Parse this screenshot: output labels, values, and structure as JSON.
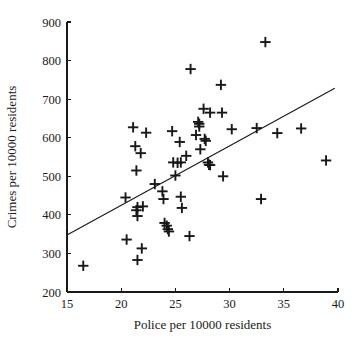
{
  "chart_data": {
    "type": "scatter",
    "title": "",
    "xlabel": "Police per 10000 residents",
    "ylabel": "Crimes per 10000 residents",
    "xlim": [
      15,
      40
    ],
    "ylim": [
      200,
      900
    ],
    "xticks": [
      15,
      20,
      25,
      30,
      35,
      40
    ],
    "yticks": [
      200,
      300,
      400,
      500,
      600,
      700,
      800,
      900
    ],
    "xtick_labels": [
      "15",
      "20",
      "25",
      "30",
      "35",
      "40"
    ],
    "ytick_labels": [
      "200",
      "300",
      "400",
      "500",
      "600",
      "700",
      "800",
      "900"
    ],
    "grid": false,
    "legend": null,
    "marker": "plus",
    "marker_color": "#16181a",
    "line_color": "#1a1a1a",
    "trendline": {
      "label": "least-squares fit line",
      "x_start": 15.0,
      "y_start": 348,
      "x_end": 39.7,
      "y_end": 728
    },
    "points": [
      {
        "x": 16.5,
        "y": 268
      },
      {
        "x": 20.4,
        "y": 445
      },
      {
        "x": 20.5,
        "y": 336
      },
      {
        "x": 21.1,
        "y": 627
      },
      {
        "x": 21.3,
        "y": 578
      },
      {
        "x": 21.4,
        "y": 515
      },
      {
        "x": 21.4,
        "y": 412
      },
      {
        "x": 21.5,
        "y": 420
      },
      {
        "x": 21.5,
        "y": 397
      },
      {
        "x": 21.5,
        "y": 283
      },
      {
        "x": 21.8,
        "y": 560
      },
      {
        "x": 21.9,
        "y": 313
      },
      {
        "x": 22.0,
        "y": 422
      },
      {
        "x": 22.3,
        "y": 613
      },
      {
        "x": 23.1,
        "y": 480
      },
      {
        "x": 23.8,
        "y": 461
      },
      {
        "x": 23.9,
        "y": 441
      },
      {
        "x": 24.0,
        "y": 379
      },
      {
        "x": 24.2,
        "y": 372
      },
      {
        "x": 24.3,
        "y": 363
      },
      {
        "x": 24.4,
        "y": 357
      },
      {
        "x": 24.7,
        "y": 617
      },
      {
        "x": 24.8,
        "y": 536
      },
      {
        "x": 25.0,
        "y": 502
      },
      {
        "x": 25.2,
        "y": 535
      },
      {
        "x": 25.4,
        "y": 589
      },
      {
        "x": 25.5,
        "y": 536
      },
      {
        "x": 25.5,
        "y": 447
      },
      {
        "x": 25.6,
        "y": 418
      },
      {
        "x": 26.0,
        "y": 553
      },
      {
        "x": 26.3,
        "y": 345
      },
      {
        "x": 26.4,
        "y": 778
      },
      {
        "x": 26.9,
        "y": 607
      },
      {
        "x": 27.1,
        "y": 641
      },
      {
        "x": 27.2,
        "y": 636
      },
      {
        "x": 27.2,
        "y": 629
      },
      {
        "x": 27.3,
        "y": 570
      },
      {
        "x": 27.6,
        "y": 675
      },
      {
        "x": 27.7,
        "y": 597
      },
      {
        "x": 27.8,
        "y": 592
      },
      {
        "x": 28.0,
        "y": 536
      },
      {
        "x": 28.1,
        "y": 530
      },
      {
        "x": 28.2,
        "y": 529
      },
      {
        "x": 28.2,
        "y": 665
      },
      {
        "x": 29.2,
        "y": 737
      },
      {
        "x": 29.3,
        "y": 665
      },
      {
        "x": 29.4,
        "y": 500
      },
      {
        "x": 30.2,
        "y": 622
      },
      {
        "x": 32.5,
        "y": 625
      },
      {
        "x": 32.9,
        "y": 441
      },
      {
        "x": 33.3,
        "y": 848
      },
      {
        "x": 34.4,
        "y": 612
      },
      {
        "x": 36.6,
        "y": 624
      },
      {
        "x": 38.9,
        "y": 541
      }
    ]
  },
  "geometry": {
    "plot_left": 67,
    "plot_right": 338,
    "plot_top": 22,
    "plot_bottom": 292,
    "marker_size": 5.2,
    "tick_len": 4
  }
}
